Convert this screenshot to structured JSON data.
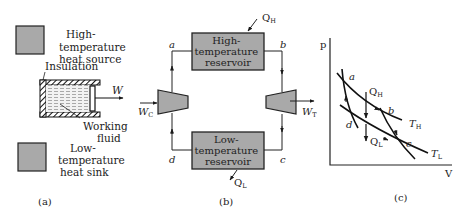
{
  "colors": {
    "reservoir_fill": "#a9a9a9",
    "line": "#1a1a1a",
    "background": "#ffffff"
  },
  "panel_a": {
    "caption": "(a)",
    "high_source_label": [
      "High-",
      "temperature",
      "heat source"
    ],
    "insulation_label": "Insulation",
    "work_label": "W",
    "working_fluid_label": [
      "Working",
      "fluid"
    ],
    "low_sink_label": [
      "Low-",
      "temperature",
      "heat sink"
    ]
  },
  "panel_b": {
    "caption": "(b)",
    "high_reservoir_label": [
      "High-",
      "temperature",
      "reservoir"
    ],
    "low_reservoir_label": [
      "Low-",
      "temperature",
      "reservoir"
    ],
    "q_high": "Q",
    "q_high_sub": "H",
    "q_low": "Q",
    "q_low_sub": "L",
    "w_compressor": "W",
    "w_compressor_sub": "C",
    "w_turbine": "W",
    "w_turbine_sub": "T",
    "state_a": "a",
    "state_b": "b",
    "state_c": "c",
    "state_d": "d"
  },
  "panel_c": {
    "caption": "(c)",
    "y_axis": "p",
    "x_axis": "V",
    "state_a": "a",
    "state_b": "b",
    "state_c": "c",
    "state_d": "d",
    "q_high": "Q",
    "q_high_sub": "H",
    "q_low": "Q",
    "q_low_sub": "L",
    "t_high": "T",
    "t_high_sub": "H",
    "t_low": "T",
    "t_low_sub": "L"
  }
}
